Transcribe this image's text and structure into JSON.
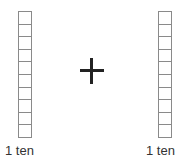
{
  "left_block": {
    "label": "1 ten",
    "units": 10
  },
  "operator": {
    "symbol": "+",
    "icon": "plus-icon"
  },
  "right_block": {
    "label": "1 ten",
    "units": 10
  },
  "colors": {
    "grid_line": "#8a8a8a",
    "operator": "#222222",
    "text": "#333333"
  }
}
